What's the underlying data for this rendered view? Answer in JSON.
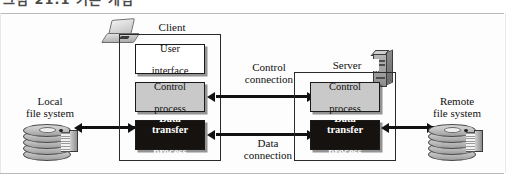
{
  "page": {
    "top_cut_text": "그림 21.1  기본 개념",
    "background": "#ffffff",
    "frame_border_color": "#b9b9b9"
  },
  "diagram": {
    "client": {
      "title": "Client",
      "icon": "laptop-icon",
      "boxes": [
        {
          "id": "user-interface",
          "label": "User\ninterface",
          "line1": "User",
          "line2": "interface",
          "style": "white",
          "fill": "#ffffff",
          "text_color": "#111111"
        },
        {
          "id": "client-control",
          "label": "Control\nprocess",
          "line1": "Control",
          "line2": "process",
          "style": "gray",
          "fill": "#c9c9c9",
          "text_color": "#111111"
        },
        {
          "id": "client-data-transfer",
          "label": "Data transfer\nprocess",
          "line1": "Data transfer",
          "line2": "process",
          "style": "black",
          "fill": "#15120f",
          "text_color": "#ffffff"
        }
      ]
    },
    "server": {
      "title": "Server",
      "icon": "server-tower-icon",
      "boxes": [
        {
          "id": "server-control",
          "label": "Control\nprocess",
          "line1": "Control",
          "line2": "process",
          "style": "gray",
          "fill": "#c9c9c9",
          "text_color": "#111111"
        },
        {
          "id": "server-data-transfer",
          "label": "Data transfer\nprocess",
          "line1": "Data transfer",
          "line2": "process",
          "style": "black",
          "fill": "#15120f",
          "text_color": "#ffffff"
        }
      ]
    },
    "storage": [
      {
        "id": "local-file-system",
        "line1": "Local",
        "line2": "file system",
        "icon": "disk-stack-icon",
        "side": "left"
      },
      {
        "id": "remote-file-system",
        "line1": "Remote",
        "line2": "file system",
        "icon": "disk-stack-icon",
        "side": "right"
      }
    ],
    "connections": [
      {
        "id": "control-connection",
        "line1": "Control",
        "line2": "connection",
        "from": "client-control",
        "to": "server-control",
        "direction": "bidirectional"
      },
      {
        "id": "data-connection",
        "line1": "Data",
        "line2": "connection",
        "from": "client-data-transfer",
        "to": "server-data-transfer",
        "direction": "bidirectional"
      }
    ],
    "storage_links": [
      {
        "id": "local-link",
        "direction": "bidirectional"
      },
      {
        "id": "remote-link",
        "direction": "bidirectional"
      }
    ]
  }
}
